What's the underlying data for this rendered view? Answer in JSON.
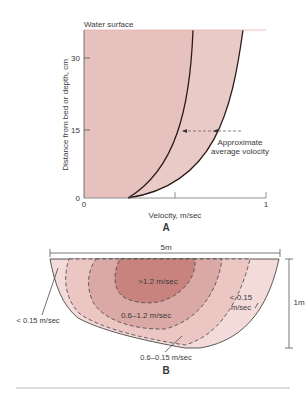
{
  "figure_a": {
    "panel_label": "A",
    "water_surface_label": "Water surface",
    "y_axis_label": "Distance from bed or depth, cm",
    "x_axis_label": "Velocity, m/sec",
    "y_ticks": [
      "0",
      "15",
      "30"
    ],
    "x_ticks": [
      "0",
      "1"
    ],
    "annotation_line1": "Approximate",
    "annotation_line2": "average volocity"
  },
  "figure_b": {
    "panel_label": "B",
    "width_label": "5m",
    "depth_label": "1m",
    "zones": [
      {
        "label": ">1.2 m/sec",
        "color": "#c9837f"
      },
      {
        "label": "0.6–1.2 m/sec",
        "color": "#dba9a5"
      },
      {
        "label": "0.6–0.15 m/sec",
        "color": "#ebc6c3"
      },
      {
        "label": "< 0.15 m/sec",
        "color": "#f3dbd9"
      }
    ],
    "label_left": "< 0.15 m/sec",
    "label_right_line1": "< 0.15",
    "label_right_line2": "m/sec",
    "label_center": ">1.2 m/sec",
    "label_mid": "0.6–1.2 m/sec",
    "label_bottom": "0.6–0.15 m/sec"
  },
  "colors": {
    "fill_a": "#e6c1bd",
    "fill_a_light": "#eed2cf",
    "line": "#2a1a1a"
  }
}
